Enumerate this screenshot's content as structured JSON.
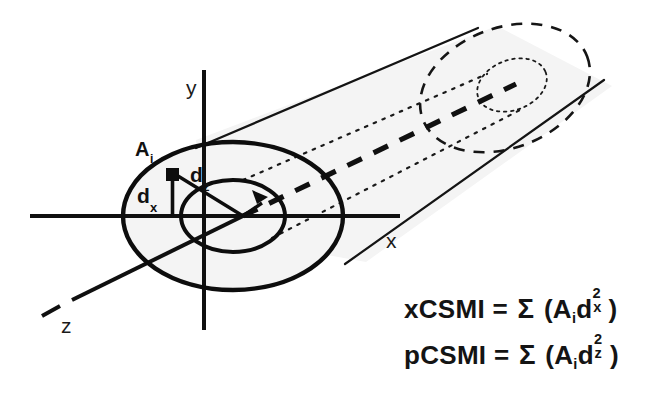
{
  "diagram": {
    "axes": {
      "x_label": "x",
      "y_label": "y",
      "z_label": "z"
    },
    "annotations": {
      "area_element": "A",
      "area_element_sub": "i",
      "distance_x": "d",
      "distance_x_sub": "x",
      "distance_z": "d",
      "distance_z_sub": "z"
    },
    "colors": {
      "ink": "#141414",
      "shading": "#f2f2f2",
      "background": "#ffffff"
    }
  },
  "formulas": {
    "line1": {
      "name": "xCSMI",
      "equals": "=",
      "sigma": "Σ",
      "open_paren": "(",
      "area": "A",
      "area_sub": "i",
      "d": "d",
      "exponent": "2",
      "axis_sub": "x",
      "close_paren": ")",
      "plain": "xCSMI = Σ (Aᵢd²ₓ)"
    },
    "line2": {
      "name": "pCSMI",
      "equals": "=",
      "sigma": "Σ",
      "open_paren": "(",
      "area": "A",
      "area_sub": "i",
      "d": "d",
      "exponent": "2",
      "axis_sub": "z",
      "close_paren": ")",
      "plain": "pCSMI = Σ (Aᵢd²ᶬ)"
    }
  }
}
